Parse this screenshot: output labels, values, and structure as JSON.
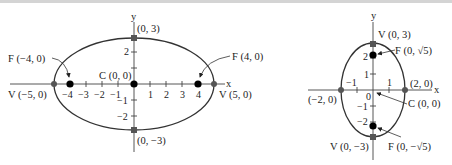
{
  "diagrams": [
    {
      "name": "horizontal-ellipse",
      "axis_x_label": "x",
      "axis_y_label": "y",
      "x_ticks": [
        "−4",
        "−3",
        "−2",
        "−1",
        "1",
        "2",
        "3",
        "4"
      ],
      "y_ticks": [
        "2",
        "−1",
        "−2"
      ],
      "labels": {
        "top_vertex": "(0,  3)",
        "bottom_vertex": "(0, −3)",
        "center": "C (0, 0)",
        "left_focus": "F (−4, 0)",
        "right_focus": "F (4, 0)",
        "left_vertex": "V (−5, 0)",
        "right_vertex": "V (5, 0)"
      }
    },
    {
      "name": "vertical-ellipse",
      "axis_x_label": "x",
      "axis_y_label": "y",
      "x_ticks": [
        "−1",
        "1"
      ],
      "origin_tick": "0",
      "y_ticks": [
        "2",
        "1",
        "−1",
        "−2"
      ],
      "labels": {
        "top_vertex": "V (0, 3)",
        "bottom_vertex": "V (0, −3)",
        "top_focus": "F (0, √5)",
        "bottom_focus": "F (0, −√5)",
        "center": "C (0, 0)",
        "right_covertex": "(2, 0)",
        "left_covertex": "(−2, 0)"
      }
    }
  ],
  "colors": {
    "curve": "#333333",
    "vertex_marker": "#555555",
    "focus_marker": "#000000"
  }
}
